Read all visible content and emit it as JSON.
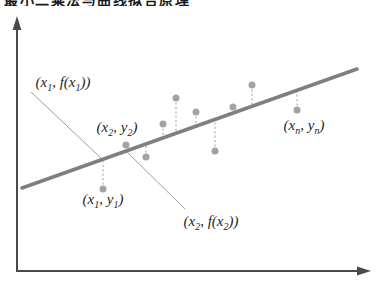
{
  "cropped_title_fragment": "最小二乘法与曲线拟合原理",
  "diagram": {
    "background": "#ffffff",
    "axes": {
      "color": "#4a4a4a",
      "stroke_width": 2,
      "origin": {
        "x": 17,
        "y": 271
      },
      "x_tip": {
        "x": 371,
        "y": 271
      },
      "y_tip": {
        "x": 17,
        "y": 16
      },
      "arrow_length": 14,
      "arrow_half_width": 4.4
    },
    "fit_line": {
      "x1": 22,
      "y1": 188,
      "x2": 357,
      "y2": 69,
      "color": "#7f7f7f",
      "width": 3.5
    },
    "points": {
      "color": "#a3a3a3",
      "radius": 3.5,
      "residual_color": "#b8b8b8",
      "items": [
        {
          "x": 103,
          "y": 189
        },
        {
          "x": 126,
          "y": 145
        },
        {
          "x": 146,
          "y": 157
        },
        {
          "x": 163,
          "y": 124
        },
        {
          "x": 176,
          "y": 98
        },
        {
          "x": 196,
          "y": 112
        },
        {
          "x": 215,
          "y": 151
        },
        {
          "x": 233,
          "y": 107
        },
        {
          "x": 252,
          "y": 85
        },
        {
          "x": 297,
          "y": 110
        }
      ]
    },
    "leaders": {
      "color": "#9e9e9e",
      "items": [
        {
          "x1": 31,
          "y1": 92,
          "x2": 103,
          "y2": 160
        },
        {
          "x1": 125,
          "y1": 150,
          "x2": 185,
          "y2": 209
        }
      ]
    },
    "labels": [
      {
        "name": "label-x1-fx1",
        "x": 63,
        "y": 82,
        "segments": [
          {
            "t": "(x"
          },
          {
            "t": "1",
            "sub": true
          },
          {
            "t": ", f(x"
          },
          {
            "t": "1",
            "sub": true
          },
          {
            "t": "))"
          }
        ]
      },
      {
        "name": "label-x2-y2",
        "x": 117,
        "y": 127,
        "segments": [
          {
            "t": "(x"
          },
          {
            "t": "2",
            "sub": true
          },
          {
            "t": ", y"
          },
          {
            "t": "2",
            "sub": true
          },
          {
            "t": ")"
          }
        ]
      },
      {
        "name": "label-x1-y1",
        "x": 103,
        "y": 199,
        "segments": [
          {
            "t": "(x"
          },
          {
            "t": "1",
            "sub": true
          },
          {
            "t": ", y"
          },
          {
            "t": "1",
            "sub": true
          },
          {
            "t": ")"
          }
        ]
      },
      {
        "name": "label-x2-fx2",
        "x": 211,
        "y": 221,
        "segments": [
          {
            "t": "(x"
          },
          {
            "t": "2",
            "sub": true
          },
          {
            "t": ", f(x"
          },
          {
            "t": "2",
            "sub": true
          },
          {
            "t": "))"
          }
        ]
      },
      {
        "name": "label-xn-yn",
        "x": 304,
        "y": 125,
        "segments": [
          {
            "t": "(x"
          },
          {
            "t": "n",
            "sub": true
          },
          {
            "t": ", y"
          },
          {
            "t": "n",
            "sub": true
          },
          {
            "t": ")"
          }
        ]
      }
    ]
  }
}
